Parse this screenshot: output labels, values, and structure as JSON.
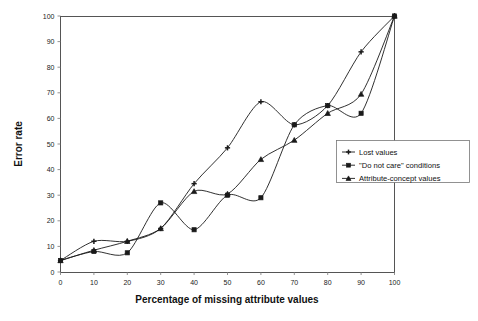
{
  "chart_data": {
    "type": "line",
    "title": "",
    "xlabel": "Percentage of missing attribute values",
    "ylabel": "Error rate",
    "xlim": [
      0,
      100
    ],
    "ylim": [
      0,
      100
    ],
    "xticks": [
      0,
      10,
      20,
      30,
      40,
      50,
      60,
      70,
      80,
      90,
      100
    ],
    "yticks": [
      0,
      10,
      20,
      30,
      40,
      50,
      60,
      70,
      80,
      90,
      100
    ],
    "grid": false,
    "legend_position": "center-right",
    "x": [
      0,
      10,
      20,
      30,
      40,
      50,
      60,
      70,
      80,
      90,
      100
    ],
    "series": [
      {
        "name": "Lost values",
        "marker": "plus",
        "values": [
          4.5,
          12,
          12,
          17,
          34.5,
          48.5,
          66.5,
          57.5,
          65,
          86,
          100
        ]
      },
      {
        "name": "\"Do not care\" conditions",
        "marker": "square",
        "values": [
          4.5,
          8,
          7.5,
          27,
          16.5,
          30,
          29,
          57.5,
          65,
          62,
          100
        ]
      },
      {
        "name": "Attribute-concept values",
        "marker": "triangle",
        "values": [
          4.5,
          8.5,
          12,
          17,
          31.5,
          30.5,
          44,
          51.5,
          62,
          69.5,
          100
        ]
      }
    ]
  },
  "axes": {
    "x_title": "Percentage of missing attribute values",
    "y_title": "Error rate",
    "x_tick_labels": [
      "0",
      "10",
      "20",
      "30",
      "40",
      "50",
      "60",
      "70",
      "80",
      "90",
      "100"
    ],
    "y_tick_labels": [
      "0",
      "10",
      "20",
      "30",
      "40",
      "50",
      "60",
      "70",
      "80",
      "90",
      "100"
    ]
  },
  "legend": {
    "entries": [
      {
        "label": "Lost values",
        "marker": "plus-marker"
      },
      {
        "label": "\"Do not care\" conditions",
        "marker": "square-marker"
      },
      {
        "label": "Attribute-concept values",
        "marker": "triangle-marker"
      }
    ]
  },
  "colors": {
    "line": "#1a1a1a",
    "axis": "#555555",
    "background": "#ffffff"
  }
}
